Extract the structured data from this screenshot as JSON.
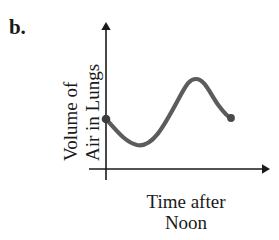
{
  "figure": {
    "part_label": "b.",
    "background_color": "#ffffff",
    "axis_color": "#1a1a1a",
    "curve_color": "#5c5c5c",
    "dot_color": "#444444"
  },
  "y_axis": {
    "label_line1": "Volume of",
    "label_line2": "Air in Lungs"
  },
  "x_axis": {
    "label_line1": "Time after",
    "label_line2": "Noon"
  },
  "chart_data": {
    "type": "line",
    "title": "",
    "xlabel": "Time after Noon",
    "ylabel": "Volume of Air in Lungs",
    "grid": false,
    "legend": null,
    "axis_ticks": {
      "x": [],
      "y": []
    },
    "axes_geometry": {
      "origin_x": 106,
      "origin_y": 169,
      "y_axis_top": 22,
      "y_axis_bottom": 180,
      "x_axis_left": 89,
      "x_axis_right": 268
    },
    "annotations": [
      {
        "name": "start-point",
        "x": 106,
        "y": 119,
        "marker": "filled-circle"
      },
      {
        "name": "end-point",
        "x": 231,
        "y": 118,
        "marker": "filled-circle"
      }
    ],
    "points": [
      {
        "x": 106,
        "y": 119
      },
      {
        "x": 118,
        "y": 132
      },
      {
        "x": 128,
        "y": 142
      },
      {
        "x": 137,
        "y": 145
      },
      {
        "x": 148,
        "y": 140
      },
      {
        "x": 158,
        "y": 128
      },
      {
        "x": 168,
        "y": 112
      },
      {
        "x": 178,
        "y": 95
      },
      {
        "x": 187,
        "y": 84
      },
      {
        "x": 195,
        "y": 79
      },
      {
        "x": 205,
        "y": 83
      },
      {
        "x": 214,
        "y": 94
      },
      {
        "x": 223,
        "y": 108
      },
      {
        "x": 231,
        "y": 118
      }
    ],
    "curve_path": "M 106 119 C 117 131 125 142 137 145 C 152 148 163 128 178 100 C 187 83 190 79 196 79 C 205 79 210 94 219 106 C 225 114 228 117 231 118",
    "extrema": [
      {
        "type": "minimum",
        "x": 137,
        "y": 145
      },
      {
        "type": "maximum",
        "x": 195,
        "y": 79
      }
    ]
  }
}
